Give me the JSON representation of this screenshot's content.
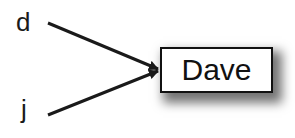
{
  "diagram": {
    "sources": [
      {
        "id": "d",
        "label": "d"
      },
      {
        "id": "j",
        "label": "j"
      }
    ],
    "target": {
      "id": "dave",
      "label": "Dave"
    },
    "edges": [
      {
        "from": "d",
        "to": "dave"
      },
      {
        "from": "j",
        "to": "dave"
      }
    ],
    "colors": {
      "line": "#1a1a1a",
      "box_border": "#111111",
      "box_fill": "#ffffff"
    }
  }
}
